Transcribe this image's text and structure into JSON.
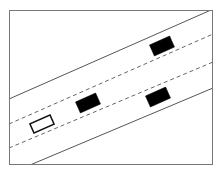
{
  "diagram": {
    "title": "",
    "colors": {
      "background": "#ffffff",
      "frame": "#777777",
      "road_edge": "#555555",
      "lane_divider": "#666666",
      "vehicle_fill": "#000000",
      "ego_vehicle_fill": "#ffffff",
      "ego_vehicle_stroke": "#111111"
    },
    "frame": {
      "x": 9,
      "y": 10,
      "width": 204,
      "height": 155
    },
    "road": {
      "lanes": 3,
      "edges": [
        {
          "name": "top-road-edge",
          "x1": 9,
          "y1": 99,
          "x2": 211,
          "y2": 10,
          "style": "solid"
        },
        {
          "name": "bottom-road-edge",
          "x1": 30,
          "y1": 165,
          "x2": 213,
          "y2": 88,
          "style": "solid"
        }
      ],
      "dividers": [
        {
          "name": "lane-divider-1",
          "x1": 9,
          "y1": 124,
          "x2": 213,
          "y2": 34,
          "style": "dashed"
        },
        {
          "name": "lane-divider-2",
          "x1": 9,
          "y1": 148,
          "x2": 213,
          "y2": 62,
          "style": "dashed"
        }
      ]
    },
    "vehicles": [
      {
        "name": "ego-vehicle",
        "type": "outline",
        "cx": 42,
        "cy": 124,
        "w": 22,
        "h": 10,
        "angle": -24,
        "lane": 2
      },
      {
        "name": "vehicle-1",
        "type": "solid",
        "cx": 88,
        "cy": 103,
        "w": 22,
        "h": 12,
        "angle": -24,
        "lane": 1
      },
      {
        "name": "vehicle-2",
        "type": "solid",
        "cx": 162,
        "cy": 46,
        "w": 22,
        "h": 12,
        "angle": -24,
        "lane": 1
      },
      {
        "name": "vehicle-3",
        "type": "solid",
        "cx": 158,
        "cy": 97,
        "w": 22,
        "h": 12,
        "angle": -24,
        "lane": 2
      }
    ]
  }
}
